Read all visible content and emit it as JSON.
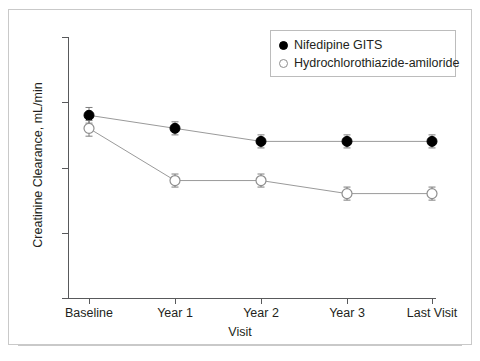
{
  "chart_data": {
    "type": "line",
    "title": "",
    "xlabel": "Visit",
    "ylabel": "Creatinine Clearance, mL/min",
    "categories": [
      "Baseline",
      "Year 1",
      "Year 2",
      "Year 3",
      "Last Visit"
    ],
    "ylim": [
      60,
      80
    ],
    "yticks": [
      60,
      65,
      70,
      75,
      80
    ],
    "ytick_labels": [
      "60",
      "65",
      "70",
      "75",
      "80"
    ],
    "grid": false,
    "legend_position": "top-right",
    "series": [
      {
        "name": "Nifedipine GITS",
        "marker": "filled-circle",
        "color": "#000000",
        "values": [
          74,
          73,
          72,
          72,
          72
        ],
        "errors": [
          0.6,
          0.5,
          0.5,
          0.5,
          0.5
        ]
      },
      {
        "name": "Hydrochlorothiazide-amiloride",
        "marker": "open-circle",
        "color": "#ffffff",
        "edge_color": "#8e8e8e",
        "values": [
          73,
          69,
          69,
          68,
          68
        ],
        "errors": [
          0.6,
          0.5,
          0.5,
          0.5,
          0.5
        ]
      }
    ]
  },
  "legend": {
    "items": [
      {
        "label": "Nifedipine GITS",
        "marker": "filled-circle"
      },
      {
        "label": "Hydrochlorothiazide-amiloride",
        "marker": "open-circle"
      }
    ]
  },
  "colors": {
    "axis": "#58595b",
    "text": "#231f20",
    "frame": "#c9c9c9",
    "series_filled": "#000000",
    "series_open_edge": "#8e8e8e",
    "line": "#9a9a9a"
  }
}
